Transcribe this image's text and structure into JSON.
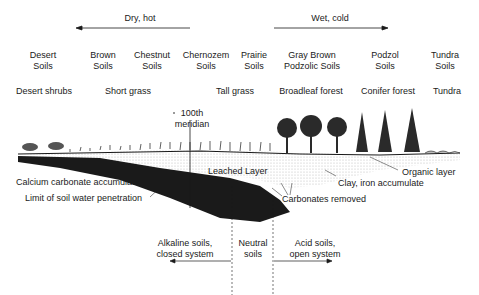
{
  "gradients": {
    "dry": {
      "label": "Dry, hot",
      "direction": "left"
    },
    "wet": {
      "label": "Wet, cold",
      "direction": "right"
    }
  },
  "soils": [
    {
      "line1": "Desert",
      "line2": "Soils"
    },
    {
      "line1": "Brown",
      "line2": "Soils"
    },
    {
      "line1": "Chestnut",
      "line2": "Soils"
    },
    {
      "line1": "Chernozem",
      "line2": "Soils"
    },
    {
      "line1": "Prairie",
      "line2": "Soils"
    },
    {
      "line1": "Gray Brown",
      "line2": "Podzolic Soils"
    },
    {
      "line1": "Podzol",
      "line2": "Soils"
    },
    {
      "line1": "Tundra",
      "line2": "Soils"
    }
  ],
  "vegetation": [
    "Desert shrubs",
    "Short grass",
    "Tall  grass",
    "Broadleaf forest",
    "Conifer forest",
    "Tundra"
  ],
  "meridian": {
    "line1": "100th",
    "line2": "meridian"
  },
  "annotations": {
    "leached": "Leached Layer",
    "calcium": "Calcium carbonate accumulates",
    "limit": "Limit of soil water penetration",
    "carbonates": "Carbonates removed",
    "clay": "Clay, iron accumulate",
    "organic": "Organic layer"
  },
  "systems": {
    "alkaline": {
      "line1": "Alkaline soils,",
      "line2": "closed system"
    },
    "neutral": {
      "line1": "Neutral",
      "line2": "soils"
    },
    "acid": {
      "line1": "Acid soils,",
      "line2": "open system"
    }
  },
  "colors": {
    "ink": "#1a1a1a",
    "stipple": "#bdbdbd",
    "background": "#ffffff"
  }
}
